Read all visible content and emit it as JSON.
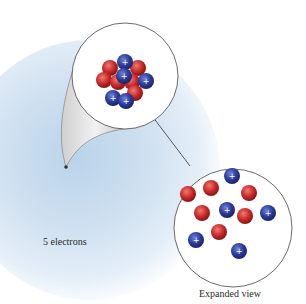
{
  "diagram": {
    "labels": {
      "electrons": "5 electrons",
      "expanded": "Expanded view"
    },
    "colors": {
      "proton": "#2b3a9a",
      "neutron": "#c62828",
      "electron_cloud": "#c6dbee",
      "outline": "#333333"
    },
    "nucleus_compact": {
      "protons": 5,
      "neutrons": 6,
      "proton_symbol": "+"
    },
    "nucleus_expanded": {
      "protons": 5,
      "neutrons": 6,
      "proton_symbol": "+"
    }
  }
}
